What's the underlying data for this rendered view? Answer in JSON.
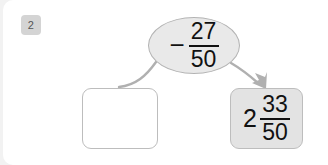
{
  "exercise": {
    "number_badge": "2"
  },
  "operand_oval": {
    "sign": "−",
    "numerator": "27",
    "denominator": "50",
    "full_text": "− 27/50"
  },
  "answer_box": {
    "value": "",
    "placeholder": ""
  },
  "result_box": {
    "whole": "2",
    "numerator": "33",
    "denominator": "50",
    "full_text": "2 33/50"
  },
  "connectors": {
    "left_curve": "curve-from-oval-to-answer-box",
    "right_arrow": "arrow-from-oval-to-result-box"
  },
  "colors": {
    "page_background": "#f2f2f2",
    "card_background": "#ffffff",
    "badge_background": "#d4d4d4",
    "badge_text": "#555555",
    "oval_fill": "#e9e9e9",
    "oval_border": "#b3b3b3",
    "answer_box_fill": "#ffffff",
    "answer_box_border": "#bdbdbd",
    "result_box_fill": "#e3e3e3",
    "result_box_border": "#bdbdbd",
    "connector_stroke": "#b0b0b0",
    "math_text": "#111111"
  }
}
